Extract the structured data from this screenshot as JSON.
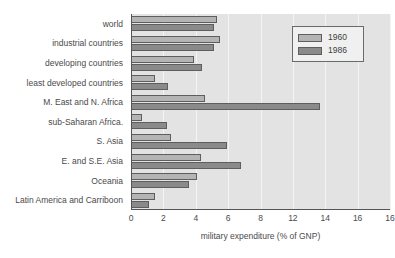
{
  "chart_data": {
    "type": "bar",
    "orientation": "horizontal",
    "title": "",
    "xlabel": "military expenditure (% of GNP)",
    "ylabel": "",
    "xlim": [
      0,
      16
    ],
    "xticks": [
      0,
      2,
      4,
      6,
      8,
      10,
      12,
      14,
      16
    ],
    "xtick_labels": [
      "0",
      "2",
      "4",
      "6",
      "8",
      "12",
      "14",
      "16"
    ],
    "grid": true,
    "legend_position": "top-right",
    "categories": [
      "world",
      "industrial countries",
      "developing countries",
      "least developed countries",
      "M. East and N. Africa",
      "sub-Saharan Africa.",
      "S. Asia",
      "E. and S.E. Asia",
      "Oceania",
      "Latin America and Carriboon"
    ],
    "series": [
      {
        "name": "1960",
        "color": "#b4b4b4",
        "values": [
          5.3,
          5.5,
          3.9,
          1.5,
          4.6,
          0.7,
          2.5,
          4.3,
          4.1,
          1.5
        ]
      },
      {
        "name": "1986",
        "color": "#8a8a8a",
        "values": [
          5.1,
          5.1,
          4.4,
          2.3,
          11.7,
          2.2,
          5.9,
          6.8,
          3.6,
          1.1
        ]
      }
    ]
  },
  "legend": {
    "entries": [
      {
        "label": "1960"
      },
      {
        "label": "1986"
      }
    ]
  },
  "colors": {
    "plot_background": "#e3e3e3",
    "gridline": "#f4f4f4",
    "axis": "#555555",
    "bar_1960": "#b4b4b4",
    "bar_1986": "#8a8a8a",
    "text": "#4a4a4a"
  }
}
